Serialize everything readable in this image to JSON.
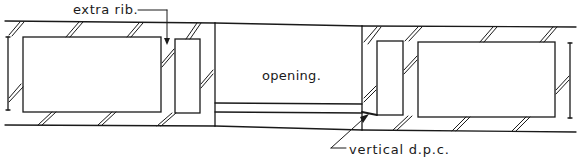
{
  "diagram": {
    "labels": {
      "extra_rib": "extra rib.",
      "opening": "opening.",
      "vertical_dpc": "vertical d.p.c."
    },
    "colors": {
      "line": "#1a1a1a",
      "background": "#ffffff"
    }
  }
}
